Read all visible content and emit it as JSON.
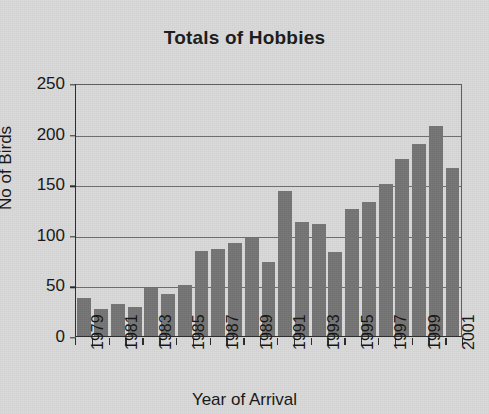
{
  "chart_data": {
    "type": "bar",
    "title": "Totals of Hobbies",
    "xlabel": "Year of Arrival",
    "ylabel": "No of Birds",
    "ylim": [
      0,
      250
    ],
    "yticks": [
      0,
      50,
      100,
      150,
      200,
      250
    ],
    "ytick_labels": [
      "0",
      "50",
      "100",
      "150",
      "200",
      "250"
    ],
    "grid": true,
    "legend": null,
    "bar_color": "#757575",
    "background_color": "#d9d9d9",
    "categories": [
      "1979",
      "1980",
      "1981",
      "1982",
      "1983",
      "1984",
      "1985",
      "1986",
      "1987",
      "1988",
      "1989",
      "1990",
      "1991",
      "1992",
      "1993",
      "1994",
      "1995",
      "1996",
      "1997",
      "1998",
      "1999",
      "2000",
      "2001"
    ],
    "xtick_labels_shown": [
      "1979",
      "",
      "1981",
      "",
      "1983",
      "",
      "1985",
      "",
      "1987",
      "",
      "1989",
      "",
      "1991",
      "",
      "1993",
      "",
      "1995",
      "",
      "1997",
      "",
      "1999",
      "",
      "2001"
    ],
    "values": [
      38,
      27,
      32,
      29,
      47,
      42,
      50,
      84,
      86,
      92,
      97,
      73,
      143,
      113,
      111,
      83,
      126,
      132,
      150,
      175,
      190,
      208,
      166
    ]
  }
}
